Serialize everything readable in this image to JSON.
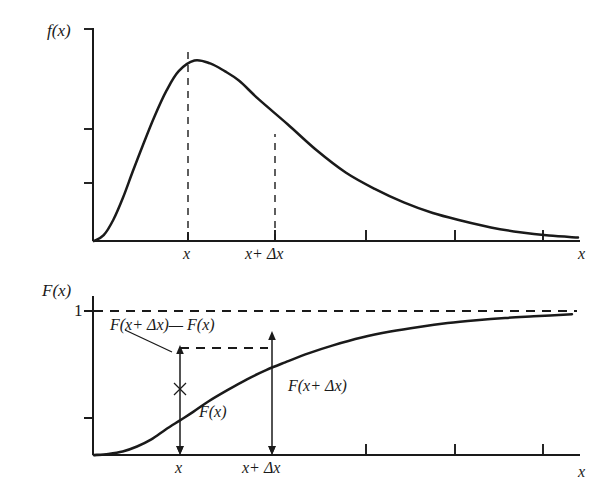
{
  "figure": {
    "background_color": "#ffffff",
    "ink_color": "#1a1a1a",
    "width": 608,
    "height": 501
  },
  "chart_data": [
    {
      "type": "line",
      "id": "pdf-plot",
      "title": "",
      "ylabel": "f(x)",
      "xlabel": "x",
      "description": "Probability density function, right-skewed unimodal curve",
      "xlim": [
        0,
        1
      ],
      "ylim": [
        0,
        1
      ],
      "grid": false,
      "legend": "none",
      "y_ticks": [
        0.33,
        0.66,
        1.0
      ],
      "y_tick_labels": [
        "",
        "",
        ""
      ],
      "x_ticks": [
        0.2,
        0.4,
        0.6,
        0.8,
        1.0
      ],
      "x_tick_labels": [
        "",
        "",
        "",
        "",
        ""
      ],
      "annotated_x_labels": [
        {
          "label": "x",
          "x": 0.2075
        },
        {
          "label": "x+ Δx",
          "x": 0.4
        }
      ],
      "dashed_verticals": [
        {
          "at_label": "x",
          "x": 0.2075,
          "y_top": 0.935
        },
        {
          "at_label": "x+ Δx",
          "x": 0.4,
          "y_top": 0.605
        }
      ],
      "x": [
        0.0,
        0.02,
        0.04,
        0.06,
        0.08,
        0.1,
        0.125,
        0.15,
        0.175,
        0.2075,
        0.24,
        0.27,
        0.3,
        0.34,
        0.4,
        0.46,
        0.52,
        0.58,
        0.64,
        0.7,
        0.76,
        0.82,
        0.88,
        0.94,
        1.0
      ],
      "y": [
        0.0,
        0.03,
        0.11,
        0.225,
        0.36,
        0.49,
        0.645,
        0.78,
        0.88,
        0.935,
        0.92,
        0.88,
        0.83,
        0.735,
        0.605,
        0.47,
        0.355,
        0.27,
        0.2,
        0.145,
        0.105,
        0.07,
        0.045,
        0.028,
        0.018
      ]
    },
    {
      "type": "line",
      "id": "cdf-plot",
      "title": "",
      "ylabel": "F(x)",
      "xlabel": "x",
      "description": "Cumulative distribution function, sigmoid rising to 1",
      "xlim": [
        0,
        1
      ],
      "ylim": [
        0,
        1.06
      ],
      "grid": false,
      "legend": "none",
      "y_ticks": [
        0.42,
        1.0
      ],
      "y_tick_labels": [
        "",
        "1"
      ],
      "x_ticks": [
        0.4,
        0.6,
        0.8,
        1.0
      ],
      "x_tick_labels": [
        "",
        "",
        "",
        ""
      ],
      "annotated_x_labels": [
        {
          "label": "x",
          "x": 0.2075
        },
        {
          "label": "x+ Δx",
          "x": 0.4
        }
      ],
      "asymptote": {
        "value": 1,
        "style": "dashed",
        "label": "1"
      },
      "markers": [
        {
          "at_label": "x",
          "x": 0.2075,
          "y": 0.305,
          "value_label": "F(x)"
        },
        {
          "at_label": "x+ Δx",
          "x": 0.4,
          "y": 0.655,
          "value_label": "F(x+ Δx)"
        }
      ],
      "difference_label": "F(x+ Δx)— F(x)",
      "x": [
        0.0,
        0.03,
        0.06,
        0.09,
        0.12,
        0.15,
        0.18,
        0.2075,
        0.24,
        0.28,
        0.32,
        0.36,
        0.4,
        0.45,
        0.5,
        0.56,
        0.62,
        0.68,
        0.74,
        0.8,
        0.86,
        0.92,
        1.0
      ],
      "y": [
        0.0,
        0.008,
        0.025,
        0.06,
        0.11,
        0.18,
        0.245,
        0.305,
        0.38,
        0.46,
        0.535,
        0.6,
        0.655,
        0.72,
        0.775,
        0.83,
        0.872,
        0.905,
        0.932,
        0.952,
        0.968,
        0.98,
        0.995
      ]
    }
  ],
  "top_chart": {
    "y_axis_label": "f(x)",
    "x_axis_label": "x",
    "x_tick_label_1": "x",
    "x_tick_label_2": "x+ Δx"
  },
  "bottom_chart": {
    "y_axis_label": "F(x)",
    "y_tick_label_one": "1",
    "x_axis_label": "x",
    "x_tick_label_1": "x",
    "x_tick_label_2": "x+ Δx",
    "annotation_difference": "F(x+ Δx)— F(x)",
    "annotation_fx": "F(x)",
    "annotation_fx_dx": "F(x+ Δx)"
  }
}
